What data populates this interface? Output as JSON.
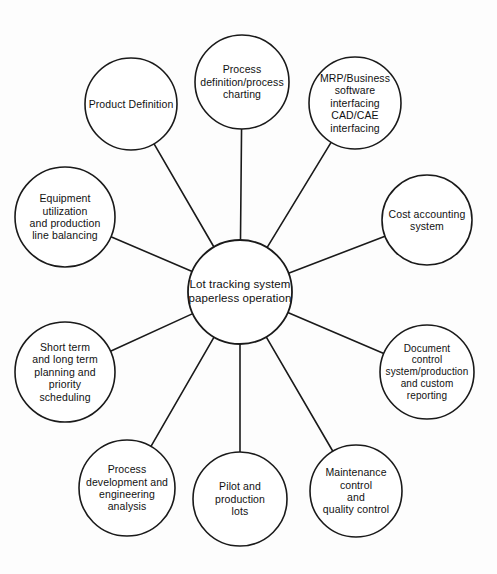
{
  "diagram": {
    "type": "hub-and-spoke",
    "title_text": "Lot tracking system paperless operation",
    "stroke_color": "#1a1a1a",
    "fill_color": "#ffffff",
    "text_color": "#111111",
    "background_color": "#fdfdfd",
    "hub": {
      "id": "hub",
      "label": "Lot tracking system\npaperless operation",
      "cx": 240,
      "cy": 292,
      "r": 52
    },
    "nodes": [
      {
        "id": "product-definition",
        "label": "Product Definition",
        "cx": 131,
        "cy": 104,
        "r": 46,
        "box_w": 92,
        "font": "spoke-label"
      },
      {
        "id": "process-definition",
        "label": "Process\ndefinition/process\ncharting",
        "cx": 242,
        "cy": 82,
        "r": 47,
        "box_w": 92,
        "font": "spoke-label"
      },
      {
        "id": "mrp-business-software",
        "label": "MRP/Business\nsoftware\ninterfacing\nCAD/CAE\ninterfacing",
        "cx": 355,
        "cy": 103,
        "r": 46,
        "box_w": 90,
        "font": "spoke-label"
      },
      {
        "id": "cost-accounting-system",
        "label": "Cost accounting\nsystem",
        "cx": 427,
        "cy": 220,
        "r": 45,
        "box_w": 88,
        "font": "spoke-label"
      },
      {
        "id": "document-control-system",
        "label": "Document\ncontrol\nsystem/production\nand custom\nreporting",
        "cx": 427,
        "cy": 372,
        "r": 47,
        "box_w": 94,
        "font": "sp-wide"
      },
      {
        "id": "maintenance-quality-control",
        "label": "Maintenance\ncontrol\nand\nquality control",
        "cx": 356,
        "cy": 491,
        "r": 46,
        "box_w": 90,
        "font": "spoke-label"
      },
      {
        "id": "pilot-production-lots",
        "label": "Pilot and\nproduction\nlots",
        "cx": 240,
        "cy": 499,
        "r": 47,
        "box_w": 88,
        "font": "spoke-label"
      },
      {
        "id": "process-development",
        "label": "Process\ndevelopment and\nengineering\nanalysis",
        "cx": 127,
        "cy": 488,
        "r": 48,
        "box_w": 94,
        "font": "spoke-label"
      },
      {
        "id": "short-long-term-planning",
        "label": "Short term\nand long term\nplanning and\npriority\nscheduling",
        "cx": 65,
        "cy": 372,
        "r": 50,
        "box_w": 94,
        "font": "spoke-label"
      },
      {
        "id": "equipment-utilization",
        "label": "Equipment\nutilization\nand production\nline balancing",
        "cx": 65,
        "cy": 217,
        "r": 50,
        "box_w": 96,
        "font": "spoke-label"
      }
    ],
    "connectors": [
      {
        "from": "hub",
        "to": "product-definition"
      },
      {
        "from": "hub",
        "to": "process-definition"
      },
      {
        "from": "hub",
        "to": "mrp-business-software"
      },
      {
        "from": "hub",
        "to": "cost-accounting-system"
      },
      {
        "from": "hub",
        "to": "document-control-system"
      },
      {
        "from": "hub",
        "to": "maintenance-quality-control"
      },
      {
        "from": "hub",
        "to": "pilot-production-lots"
      },
      {
        "from": "hub",
        "to": "process-development"
      },
      {
        "from": "hub",
        "to": "short-long-term-planning"
      },
      {
        "from": "hub",
        "to": "equipment-utilization"
      }
    ]
  }
}
